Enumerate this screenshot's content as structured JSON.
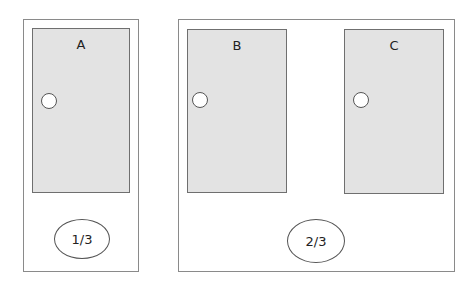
{
  "groups": [
    {
      "fraction": "1/3",
      "doors": [
        {
          "label": "A"
        }
      ]
    },
    {
      "fraction": "2/3",
      "doors": [
        {
          "label": "B"
        },
        {
          "label": "C"
        }
      ]
    }
  ],
  "colors": {
    "door_fill": "#e3e3e3",
    "border": "#8a8a8a",
    "background": "#ffffff"
  }
}
